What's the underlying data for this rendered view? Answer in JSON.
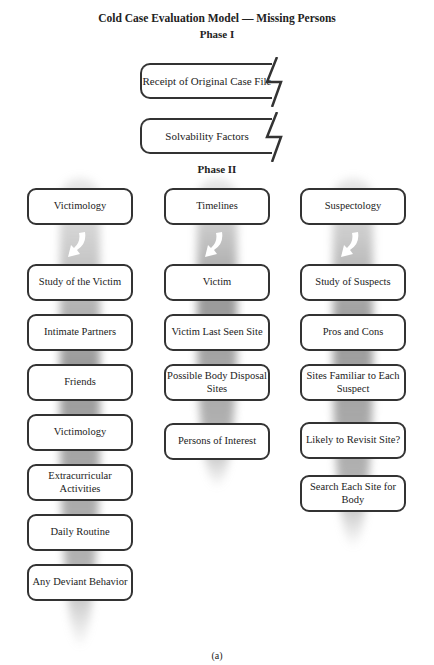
{
  "title": "Cold Case Evaluation Model — Missing Persons",
  "phase1": {
    "label": "Phase I",
    "boxes": [
      "Receipt of Original Case File",
      "Solvability Factors"
    ]
  },
  "phase2": {
    "label": "Phase II",
    "columns": [
      {
        "header": "Victimology",
        "items": [
          "Study of the Victim",
          "Intimate Partners",
          "Friends",
          "Victimology",
          "Extracurricular Activities",
          "Daily Routine",
          "Any Deviant Behavior"
        ]
      },
      {
        "header": "Timelines",
        "items": [
          "Victim",
          "Victim Last Seen Site",
          "Possible Body Disposal Sites",
          "Persons of Interest"
        ]
      },
      {
        "header": "Suspectology",
        "items": [
          "Study of Suspects",
          "Pros and Cons",
          "Sites Familiar to Each Suspect",
          "Likely to Revisit Site?",
          "Search Each Site for Body"
        ]
      }
    ]
  },
  "caption": "(a)"
}
